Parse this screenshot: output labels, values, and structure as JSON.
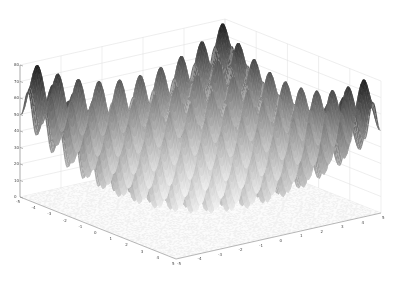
{
  "chart_data": {
    "type": "surface3d",
    "title": "",
    "function": "Rastrigin: z = 20 + x^2 + y^2 - 10(cos(2*pi*x) + cos(2*pi*y))",
    "xlabel": "",
    "ylabel": "",
    "zlabel": "",
    "xlim": [
      -5,
      5
    ],
    "ylim": [
      -5,
      5
    ],
    "zlim": [
      0,
      80
    ],
    "x_ticks": [
      -5,
      -4,
      -3,
      -2,
      -1,
      0,
      1,
      2,
      3,
      4,
      5
    ],
    "y_ticks": [
      -5,
      -4,
      -3,
      -2,
      -1,
      0,
      1,
      2,
      3,
      4,
      5
    ],
    "z_ticks": [
      0,
      10,
      20,
      30,
      40,
      50,
      60,
      70,
      80
    ],
    "colormap": "gray (dark at peaks, light at low values)",
    "floor_contour": true,
    "grid": true,
    "box": true
  },
  "colors": {
    "background": "#ffffff",
    "grid": "#dddddd",
    "axis": "#888888",
    "peak": "#222222",
    "valley": "#f2f2f2"
  }
}
